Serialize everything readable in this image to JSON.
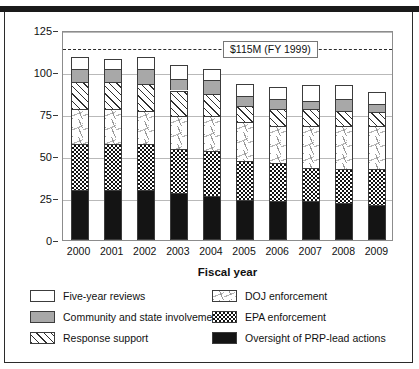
{
  "chart_data": {
    "type": "bar",
    "stacked": true,
    "title": "",
    "xlabel": "Fiscal year",
    "ylabel": "Millions of dollars",
    "ylim": [
      0,
      125
    ],
    "yticks": [
      0,
      25,
      50,
      75,
      100,
      125
    ],
    "grid": true,
    "legend_position": "bottom",
    "categories": [
      "2000",
      "2001",
      "2002",
      "2003",
      "2004",
      "2005",
      "2006",
      "2007",
      "2008",
      "2009"
    ],
    "series": [
      {
        "name": "Oversight of PRP-lead actions",
        "fill": "solid-black",
        "color": "#141414",
        "values": [
          30,
          30,
          30,
          28,
          26,
          24,
          23,
          23,
          22,
          21
        ]
      },
      {
        "name": "EPA enforcement",
        "fill": "checkerboard",
        "color": "#121212",
        "values": [
          27,
          27,
          27,
          26,
          27,
          23,
          23,
          20,
          20,
          21
        ]
      },
      {
        "name": "DOJ enforcement",
        "fill": "sparse-dash",
        "color": "#9a9a9a",
        "values": [
          21,
          21,
          20,
          20,
          21,
          23,
          22,
          25,
          26,
          26
        ]
      },
      {
        "name": "Response support",
        "fill": "diagonal-hatch",
        "color": "#2f2f2f",
        "values": [
          16,
          16,
          16,
          15,
          13,
          10,
          10,
          10,
          9,
          8
        ]
      },
      {
        "name": "Community and state involvement",
        "fill": "solid-gray",
        "color": "#a8a8a8",
        "values": [
          8,
          8,
          9,
          7,
          8,
          6,
          6,
          5,
          7,
          5
        ]
      },
      {
        "name": "Five-year reviews",
        "fill": "solid-white",
        "color": "#ffffff",
        "values": [
          7,
          6,
          7,
          8,
          7,
          7,
          7,
          9,
          8,
          7
        ]
      }
    ],
    "totals": [
      109,
      108,
      109,
      104,
      102,
      93,
      91,
      92,
      92,
      88
    ],
    "reference_line": {
      "label": "$115M (FY 1999)",
      "value": 115,
      "style": "dashed"
    }
  },
  "legend": {
    "left": [
      "Five-year reviews",
      "Community and state involvement",
      "Response support"
    ],
    "right": [
      "DOJ enforcement",
      "EPA enforcement",
      "Oversight of PRP-lead actions"
    ]
  }
}
